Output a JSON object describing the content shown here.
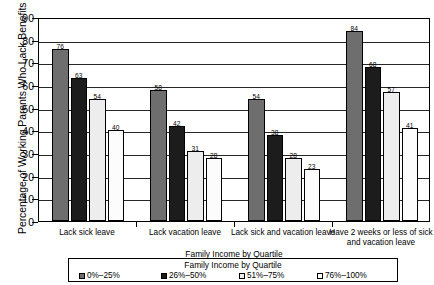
{
  "chart_data": {
    "type": "bar",
    "title": "",
    "xlabel": "Family Income by Quartile",
    "ylabel": "Percentage of Working Parents Who Lack Benefits",
    "ylim": [
      0,
      90
    ],
    "ytick_step": 10,
    "yticks": [
      "90",
      "80",
      "70",
      "60",
      "50",
      "40",
      "30",
      "20",
      "10",
      "0"
    ],
    "grid": true,
    "legend_position": "bottom",
    "legend_title": "Family Income by Quartile",
    "categories": [
      "Lack sick leave",
      "Lack vacation leave",
      "Lack sick and vacation leave",
      "Have 2 weeks or less of sick and vacation leave"
    ],
    "series": [
      {
        "name": "0%–25%",
        "color": "#6e6e6e",
        "values": [
          76,
          58,
          54,
          84
        ]
      },
      {
        "name": "26%–50%",
        "color": "#1c1c1c",
        "values": [
          63,
          42,
          38,
          68
        ]
      },
      {
        "name": "51%–75%",
        "color": "#ededed",
        "values": [
          54,
          31,
          28,
          57
        ]
      },
      {
        "name": "76%–100%",
        "color": "#fcfcfc",
        "values": [
          40,
          28,
          23,
          41
        ]
      }
    ]
  }
}
